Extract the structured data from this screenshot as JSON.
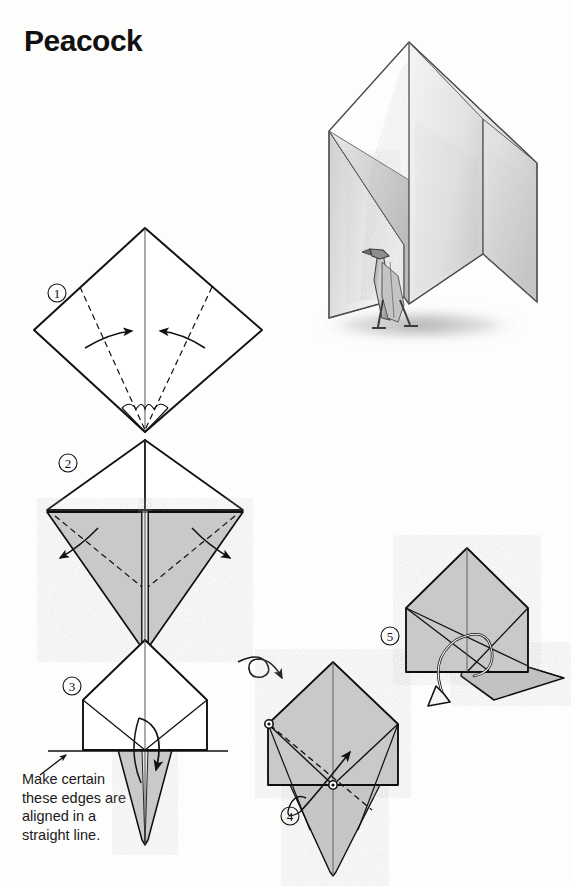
{
  "page": {
    "title": "Peacock",
    "background_color": "#fdfdfc",
    "ink_color": "#1a1a1a",
    "paper_gray": "#c9c9c9",
    "paper_gray_dark": "#b4b4b4",
    "paper_white": "#ffffff"
  },
  "illustration": {
    "name": "finished-peacock-pencil-drawing",
    "subject": "completed origami peacock with fanned tail and shadow",
    "medium": "pencil shading"
  },
  "caption": {
    "text": "Make certain\nthese edges are\naligned in a\nstraight line.",
    "lines": [
      "Make certain",
      "these edges are",
      "aligned in a",
      "straight line."
    ]
  },
  "steps": [
    {
      "number": "①",
      "digit": "1",
      "label": "step-1",
      "shape": "square rotated 45 degrees (diamond)",
      "note": "valley fold the two lower side edges to the vertical center line"
    },
    {
      "number": "②",
      "digit": "2",
      "label": "step-2",
      "shape": "kite base with shaded lower flaps",
      "note": "fold the shaded flaps back outward along the dashed lines"
    },
    {
      "number": "③",
      "digit": "3",
      "label": "step-3",
      "shape": "pentagon house shape with shaded point below",
      "note": "fold the lower point up; keep edges aligned in a straight line"
    },
    {
      "number": "④",
      "digit": "4",
      "label": "step-4",
      "shape": "shaded pentagon with diagonal dashed crease",
      "note": "turn the model over, then fold along the dashed diagonal"
    },
    {
      "number": "⑤",
      "digit": "5",
      "label": "step-5",
      "shape": "shaded body with extended neck flap",
      "note": "pull the flap out and swing it down to form the neck"
    }
  ],
  "symbols": {
    "turn_over": "turn-the-model-over-arrow",
    "valley_fold": "dashed-line",
    "fold_direction": "solid-arrow",
    "pull_out": "hollow-arrow",
    "reference_point": "small-circle-marker"
  }
}
